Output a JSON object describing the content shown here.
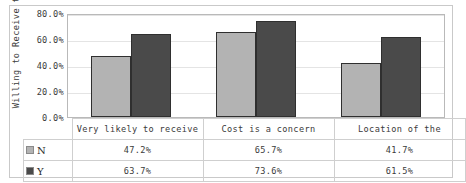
{
  "chart_data": {
    "type": "bar",
    "title": "",
    "xlabel": "",
    "ylabel": "Willing to Receive the",
    "ylim": [
      0,
      80
    ],
    "ytick_labels": [
      "0.0%",
      "20.0%",
      "40.0%",
      "60.0%",
      "80.0%"
    ],
    "ytick_values": [
      0,
      20,
      40,
      60,
      80
    ],
    "grid": true,
    "legend_position": "table-left",
    "categories": [
      "Very likely to receive",
      "Cost is a concern",
      "Location of the"
    ],
    "series": [
      {
        "name": "N",
        "color": "#b3b3b3",
        "values": [
          47.2,
          65.7,
          41.7
        ],
        "value_labels": [
          "47.2%",
          "65.7%",
          "41.7%"
        ]
      },
      {
        "name": "Y",
        "color": "#4a4a4a",
        "values": [
          63.7,
          73.6,
          61.5
        ],
        "value_labels": [
          "63.7%",
          "73.6%",
          "61.5%"
        ]
      }
    ]
  },
  "axis": {
    "y_title": "Willing to Receive the"
  },
  "table": {
    "legend_header": "",
    "rows": [
      {
        "label": "N",
        "swatch": "legend-swatch-n"
      },
      {
        "label": "Y",
        "swatch": "legend-swatch-y"
      }
    ]
  },
  "colors": {
    "series_n": "#b3b3b3",
    "series_y": "#4a4a4a",
    "bar_outline": "#2f2f2f",
    "grid": "#e4e4e4",
    "frame": "#c9c9c9",
    "text": "#3b3b3b"
  }
}
